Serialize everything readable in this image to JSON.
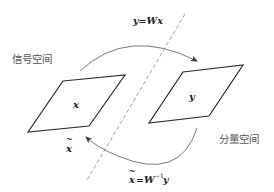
{
  "diagram": {
    "labels": {
      "signal_space": "信号空间",
      "component_space": "分量空间",
      "forward_transform": "y=Wx",
      "inverse_transform_lhs": "x",
      "inverse_transform_rhs": "=W",
      "inverse_exponent": "−1",
      "inverse_vector": "y",
      "x_in_signal": "x",
      "y_in_component": "y",
      "x_tilde": "x",
      "tilde_mark": "~"
    },
    "colors": {
      "background": "#ffffff",
      "shape_stroke": "#2a2a2a",
      "arc_stroke": "#6a6a6a",
      "dashed_divider": "#8a8a8a",
      "chinese_text": "#555555",
      "math_text": "#222222"
    },
    "shapes": {
      "signal_parallelogram": [
        [
          63,
          81
        ],
        [
          125,
          75
        ],
        [
          89,
          126
        ],
        [
          28,
          132
        ]
      ],
      "component_parallelogram": [
        [
          183,
          72
        ],
        [
          243,
          65
        ],
        [
          209,
          116
        ],
        [
          149,
          123
        ]
      ],
      "divider_line": [
        [
          185,
          14
        ],
        [
          87,
          180
        ]
      ]
    }
  }
}
